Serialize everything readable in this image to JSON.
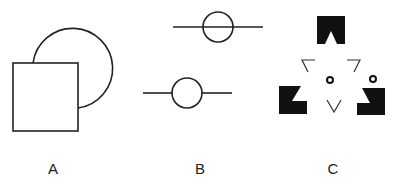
{
  "figure": {
    "stroke_color": "#222222",
    "fill_color": "#111111",
    "background": "#ffffff",
    "panels": [
      {
        "id": "A",
        "label": "A",
        "description": "Square partially occluding a circle (amodal completion)",
        "elements": {
          "square": {
            "x": 13,
            "y": 63,
            "width": 65,
            "height": 68
          },
          "circle_arc": {
            "cx": 72,
            "cy": 62,
            "r": 40,
            "visible_from": [
              33,
              63
            ],
            "visible_to": [
              78,
              108
            ]
          }
        }
      },
      {
        "id": "B",
        "label": "B",
        "description": "Circles with lines: top line passes through circle, bottom line interrupted by circle",
        "elements": {
          "top": {
            "line": {
              "x1": 173,
              "x2": 263,
              "y": 27
            },
            "circle": {
              "cx": 218,
              "cy": 27,
              "r": 15
            }
          },
          "bottom": {
            "line_left": {
              "x1": 143,
              "x2": 172,
              "y": 93
            },
            "circle": {
              "cx": 187,
              "cy": 93,
              "r": 15
            },
            "line_right": {
              "x1": 202,
              "x2": 232,
              "y": 93
            }
          }
        }
      },
      {
        "id": "C",
        "label": "C",
        "description": "Kanizsa-style illusory triangle from notched blocks, line corners and small rings",
        "elements": {
          "blocks": [
            {
              "position": "top",
              "x": 317,
              "y": 16,
              "width": 28,
              "height": 28,
              "notch": "bottom-center"
            },
            {
              "position": "bottom-left",
              "x": 279,
              "y": 86,
              "width": 28,
              "height": 28,
              "notch": "top-right"
            },
            {
              "position": "bottom-right",
              "x": 357,
              "y": 88,
              "width": 28,
              "height": 27,
              "notch": "top-left"
            }
          ],
          "corners": [
            {
              "position": "upper-left",
              "shape": "angle"
            },
            {
              "position": "upper-right",
              "shape": "angle"
            },
            {
              "position": "bottom",
              "shape": "V"
            }
          ],
          "rings": [
            {
              "cx": 330,
              "cy": 80,
              "r": 3
            },
            {
              "cx": 373,
              "cy": 79,
              "r": 3
            }
          ]
        }
      }
    ]
  }
}
